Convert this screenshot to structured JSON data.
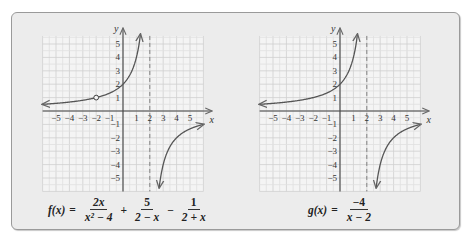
{
  "figure": {
    "panels": [
      {
        "id": "f",
        "formula": {
          "lhs": "f(x)",
          "eq": "=",
          "terms": [
            {
              "sign": "",
              "num": "2x",
              "den": "x² − 4"
            },
            {
              "sign": "+",
              "num": "5",
              "den": "2 − x"
            },
            {
              "sign": "−",
              "num": "1",
              "den": "2 + x"
            }
          ]
        }
      },
      {
        "id": "g",
        "formula": {
          "lhs": "g(x)",
          "eq": "=",
          "terms": [
            {
              "sign": "",
              "num": "−4",
              "den": "x − 2"
            }
          ]
        }
      }
    ]
  },
  "chart_data": [
    {
      "type": "line",
      "title": "f(x) = 2x/(x² − 4) + 5/(2 − x) − 1/(2 + x)",
      "xlabel": "x",
      "ylabel": "y",
      "xlim": [
        -6,
        6
      ],
      "ylim": [
        -6,
        6
      ],
      "grid": true,
      "x_ticks": [
        -5,
        -4,
        -3,
        -2,
        -1,
        1,
        2,
        3,
        4,
        5
      ],
      "y_ticks": [
        -5,
        -4,
        -3,
        -2,
        -1,
        1,
        2,
        3,
        4,
        5
      ],
      "x_tick_labels": [
        "−5",
        "−4",
        "−3",
        "−2",
        "−1",
        "1",
        "2",
        "3",
        "4",
        "5"
      ],
      "y_tick_labels": [
        "−5",
        "−4",
        "−3",
        "−2",
        "−1",
        "1",
        "2",
        "3",
        "4",
        "5"
      ],
      "vertical_asymptote": 2,
      "equivalent_expression": "-4/(x-2)",
      "open_circle": {
        "x": -2,
        "y": 1
      },
      "series": [
        {
          "name": "left branch",
          "x_range": [
            -6,
            1.3
          ],
          "arrow_ends": [
            "left",
            "up"
          ]
        },
        {
          "name": "right branch",
          "x_range": [
            2.7,
            6
          ],
          "arrow_ends": [
            "down",
            "right"
          ]
        }
      ]
    },
    {
      "type": "line",
      "title": "g(x) = −4/(x − 2)",
      "xlabel": "x",
      "ylabel": "y",
      "xlim": [
        -6,
        6
      ],
      "ylim": [
        -6,
        6
      ],
      "grid": true,
      "x_ticks": [
        -5,
        -4,
        -3,
        -2,
        -1,
        1,
        2,
        3,
        4,
        5
      ],
      "y_ticks": [
        -5,
        -4,
        -3,
        -2,
        -1,
        1,
        2,
        3,
        4,
        5
      ],
      "x_tick_labels": [
        "−5",
        "−4",
        "−3",
        "−2",
        "−1",
        "1",
        "2",
        "3",
        "4",
        "5"
      ],
      "y_tick_labels": [
        "−5",
        "−4",
        "−3",
        "−2",
        "−1",
        "1",
        "2",
        "3",
        "4",
        "5"
      ],
      "vertical_asymptote": 2,
      "expression": "-4/(x-2)",
      "open_circle": null,
      "series": [
        {
          "name": "left branch",
          "x_range": [
            -6,
            1.3
          ],
          "arrow_ends": [
            "left",
            "up"
          ]
        },
        {
          "name": "right branch",
          "x_range": [
            2.7,
            6
          ],
          "arrow_ends": [
            "down",
            "right"
          ]
        }
      ]
    }
  ]
}
